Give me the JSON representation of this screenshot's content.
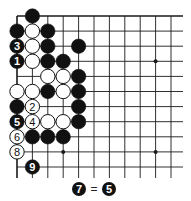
{
  "diagram": {
    "type": "go-board",
    "grid": {
      "cols": 11,
      "rows": 11,
      "x0": 17,
      "y0": 16,
      "dx": 15.4,
      "dy": 15.1,
      "right_extent": 183,
      "bottom_extent": 178,
      "top_edge": true,
      "left_edge": true
    },
    "star_points": [
      [
        9,
        3
      ],
      [
        9,
        9
      ],
      [
        3,
        9
      ]
    ],
    "stones": [
      {
        "c": 1,
        "r": 0,
        "color": "black"
      },
      {
        "c": 0,
        "r": 1,
        "color": "black"
      },
      {
        "c": 1,
        "r": 1,
        "color": "white"
      },
      {
        "c": 2,
        "r": 1,
        "color": "black"
      },
      {
        "c": 0,
        "r": 2,
        "color": "black",
        "label": "3"
      },
      {
        "c": 1,
        "r": 2,
        "color": "white"
      },
      {
        "c": 2,
        "r": 2,
        "color": "black"
      },
      {
        "c": 4,
        "r": 2,
        "color": "black"
      },
      {
        "c": 0,
        "r": 3,
        "color": "black",
        "label": "1"
      },
      {
        "c": 1,
        "r": 3,
        "color": "white"
      },
      {
        "c": 2,
        "r": 3,
        "color": "black"
      },
      {
        "c": 3,
        "r": 3,
        "color": "black"
      },
      {
        "c": 2,
        "r": 4,
        "color": "white"
      },
      {
        "c": 3,
        "r": 4,
        "color": "white"
      },
      {
        "c": 4,
        "r": 4,
        "color": "black"
      },
      {
        "c": 0,
        "r": 5,
        "color": "white"
      },
      {
        "c": 1,
        "r": 5,
        "color": "white"
      },
      {
        "c": 2,
        "r": 5,
        "color": "black"
      },
      {
        "c": 3,
        "r": 5,
        "color": "white"
      },
      {
        "c": 4,
        "r": 5,
        "color": "black"
      },
      {
        "c": 0,
        "r": 6,
        "color": "black"
      },
      {
        "c": 1,
        "r": 6,
        "color": "white",
        "label": "2"
      },
      {
        "c": 4,
        "r": 6,
        "color": "black"
      },
      {
        "c": 0,
        "r": 7,
        "color": "black",
        "label": "5"
      },
      {
        "c": 1,
        "r": 7,
        "color": "white",
        "label": "4"
      },
      {
        "c": 2,
        "r": 7,
        "color": "white"
      },
      {
        "c": 3,
        "r": 7,
        "color": "white"
      },
      {
        "c": 4,
        "r": 7,
        "color": "black"
      },
      {
        "c": 0,
        "r": 8,
        "color": "white",
        "label": "6"
      },
      {
        "c": 1,
        "r": 8,
        "color": "black"
      },
      {
        "c": 2,
        "r": 8,
        "color": "black"
      },
      {
        "c": 3,
        "r": 8,
        "color": "black"
      },
      {
        "c": 0,
        "r": 9,
        "color": "white",
        "label": "8"
      },
      {
        "c": 1,
        "r": 10,
        "color": "black",
        "label": "9"
      }
    ],
    "caption": {
      "left_stone": {
        "color": "black",
        "label": "7"
      },
      "equals": "=",
      "right_stone": {
        "color": "black",
        "label": "5"
      }
    },
    "colors": {
      "line": "#1a1a1a",
      "black_stone": "#111111",
      "white_stone": "#ffffff",
      "background": "#ffffff"
    }
  }
}
